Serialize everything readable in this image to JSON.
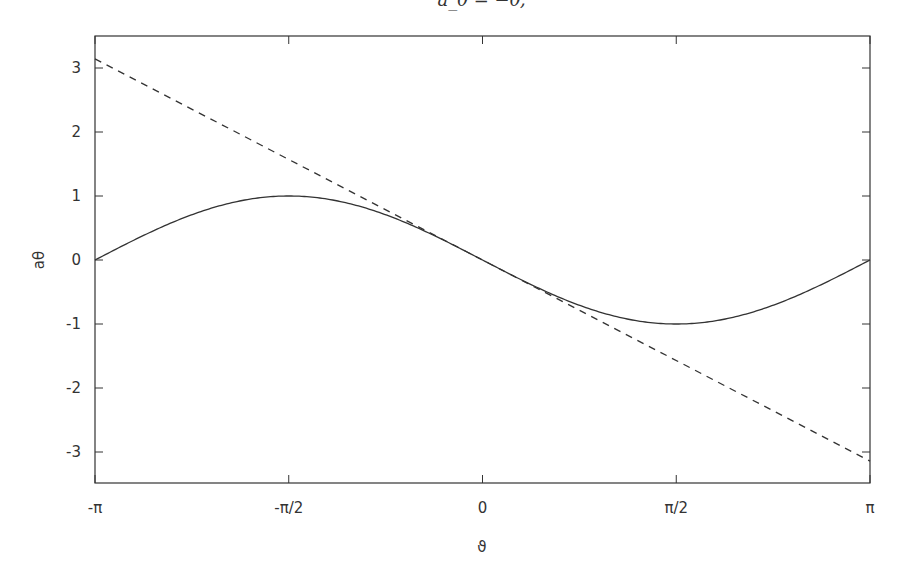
{
  "chart_data": {
    "type": "line",
    "title": "a_θ = −θ;",
    "xlabel": "ϑ",
    "ylabel": "aθ",
    "xlim": [
      -3.14159,
      3.14159
    ],
    "ylim": [
      -3.5,
      3.5
    ],
    "grid": false,
    "legend": null,
    "x_ticks": [
      {
        "value": -3.14159,
        "label": "-π"
      },
      {
        "value": -1.5708,
        "label": "-π/2"
      },
      {
        "value": 0,
        "label": "0"
      },
      {
        "value": 1.5708,
        "label": "π/2"
      },
      {
        "value": 3.14159,
        "label": "π"
      }
    ],
    "y_ticks": [
      {
        "value": 3,
        "label": "3"
      },
      {
        "value": 2,
        "label": "2"
      },
      {
        "value": 1,
        "label": "1"
      },
      {
        "value": 0,
        "label": "0"
      },
      {
        "value": -1,
        "label": "-1"
      },
      {
        "value": -2,
        "label": "-2"
      },
      {
        "value": -3,
        "label": "-3"
      }
    ],
    "series": [
      {
        "name": "-sin(θ)",
        "style": "solid",
        "color": "#333333",
        "x": [
          -3.14159,
          -2.35619,
          -1.5708,
          -0.7854,
          0,
          0.7854,
          1.5708,
          2.35619,
          3.14159
        ],
        "values": [
          0,
          0.7071,
          1,
          0.7071,
          0,
          -0.7071,
          -1,
          -0.7071,
          0
        ]
      },
      {
        "name": "-θ",
        "style": "dashed",
        "color": "#333333",
        "x": [
          -3.14159,
          3.14159
        ],
        "values": [
          3.14159,
          -3.14159
        ]
      }
    ]
  },
  "layout": {
    "frame": {
      "left": 95,
      "right": 870,
      "top": 36,
      "bottom": 483
    },
    "y_zero_px": 260,
    "y_unit_px": 64
  }
}
